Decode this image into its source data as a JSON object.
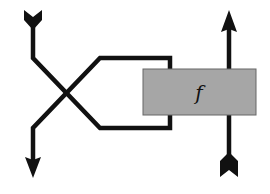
{
  "diagram": {
    "box_label": "f",
    "box_fill": "#a6a6a6",
    "line_color": "#111111"
  }
}
